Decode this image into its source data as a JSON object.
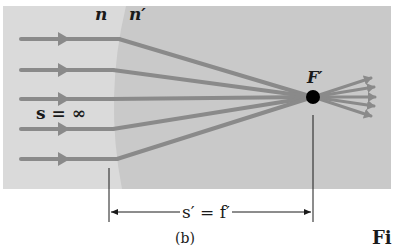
{
  "figure": {
    "panel_label": "(b)",
    "caption_fragment": "Fi",
    "labels": {
      "n": "n",
      "n_prime": "n′",
      "object_distance": "s = ∞",
      "focal_point": "F′",
      "image_distance": "s′ = f′"
    },
    "colors": {
      "medium_n": "#d9d9d9",
      "medium_n_prime": "#c8c8c8",
      "ray": "#8a8a8a",
      "focal_dot": "#000000",
      "dimension_line": "#1a1a1a",
      "background": "#ffffff"
    },
    "rays": {
      "count": 5,
      "incoming_y": [
        39,
        70,
        99,
        129,
        159
      ],
      "focal_point": {
        "x": 313,
        "y": 97
      }
    }
  }
}
